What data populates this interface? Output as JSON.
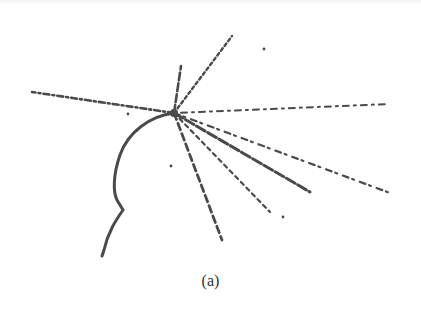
{
  "figure": {
    "caption": "(a)",
    "colors": {
      "ink": "#4a4a4a",
      "background": "#ffffff"
    },
    "vertex": {
      "x": 174,
      "y": 113
    },
    "curved_track": {
      "path": "M174,113 C150,116 128,132 120,155 C113,175 113,192 117,200 L123,210 C116,220 108,232 104,250 L102,256"
    },
    "straight_tracks": [
      {
        "x2": 32,
        "y2": 92,
        "width": 2.6,
        "dash": "6 3 2 3"
      },
      {
        "x2": 232,
        "y2": 36,
        "width": 2.4,
        "dash": "3 3"
      },
      {
        "x2": 181,
        "y2": 66,
        "width": 2.6,
        "dash": "8 3"
      },
      {
        "x2": 388,
        "y2": 104,
        "width": 2.0,
        "dash": "2 5 6 5"
      },
      {
        "x2": 310,
        "y2": 192,
        "width": 3.0,
        "dash": "10 3"
      },
      {
        "x2": 390,
        "y2": 193,
        "width": 2.2,
        "dash": "6 4 2 6"
      },
      {
        "x2": 270,
        "y2": 212,
        "width": 2.2,
        "dash": "4 4"
      },
      {
        "x2": 222,
        "y2": 240,
        "width": 2.8,
        "dash": "7 4"
      }
    ],
    "specks": [
      {
        "x": 264,
        "y": 49
      },
      {
        "x": 283,
        "y": 217
      },
      {
        "x": 171,
        "y": 166
      },
      {
        "x": 128,
        "y": 114
      }
    ]
  }
}
